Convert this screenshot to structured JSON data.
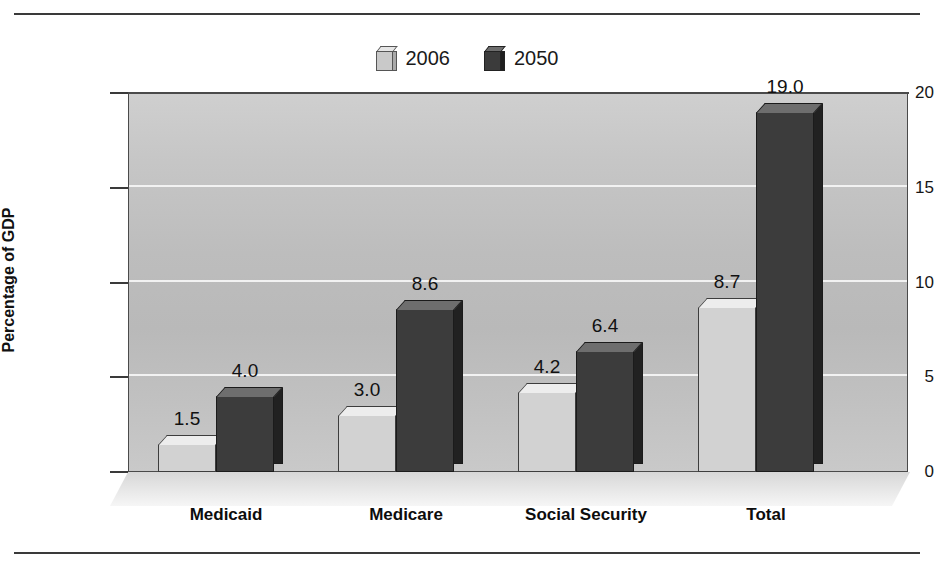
{
  "chart_data": {
    "type": "bar",
    "title": "",
    "subtitle": "",
    "xlabel": "",
    "ylabel": "Percentage of GDP",
    "ylim": [
      0,
      20
    ],
    "yticks": [
      0,
      5,
      10,
      15,
      20
    ],
    "ytick_labels": [
      "0",
      "5",
      "10",
      "15",
      "20"
    ],
    "grid": true,
    "grid_axis": "y",
    "legend_position": "top-center",
    "style": "3d-bar",
    "categories": [
      "Medicaid",
      "Medicare",
      "Social Security",
      "Total"
    ],
    "series": [
      {
        "name": "2006",
        "color": "#d2d2d2",
        "values": [
          1.5,
          3.0,
          4.2,
          8.7
        ],
        "labels": [
          "1.5",
          "3.0",
          "4.2",
          "8.7"
        ]
      },
      {
        "name": "2050",
        "color": "#3c3c3c",
        "values": [
          4.0,
          8.6,
          6.4,
          19.0
        ],
        "labels": [
          "4.0",
          "8.6",
          "6.4",
          "19.0"
        ]
      }
    ]
  },
  "legend": {
    "entries": [
      {
        "label": "2006",
        "swatch": "light-cube-icon"
      },
      {
        "label": "2050",
        "swatch": "dark-cube-icon"
      }
    ]
  },
  "axis": {
    "y_title": "Percentage of GDP"
  },
  "colors": {
    "series_2006": "#d2d2d2",
    "series_2050": "#3c3c3c",
    "plot_background": "#c2c2c2",
    "gridline": "#f2f2f2",
    "rule": "#3a3a3a",
    "text": "#111111"
  }
}
